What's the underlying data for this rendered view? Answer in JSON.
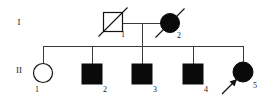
{
  "figure": {
    "type": "pedigree-chart",
    "width": 280,
    "height": 103,
    "background_color": "#ffffff",
    "line_color": "#3a3a3a",
    "symbol_color": "#0a0a0a"
  },
  "generations": [
    {
      "label": "I",
      "x": 19,
      "y": 25
    },
    {
      "label": "II",
      "x": 19,
      "y": 73
    }
  ],
  "individuals": [
    {
      "id": "I-1",
      "generation": "I",
      "number": "1",
      "sex": "male",
      "shape": "square",
      "affected": false,
      "fill": "open",
      "deceased": true,
      "proband": false,
      "cx": 113,
      "cy": 22,
      "size": 19,
      "label_x": 123,
      "label_y": 37
    },
    {
      "id": "I-2",
      "generation": "I",
      "number": "2",
      "sex": "female",
      "shape": "circle",
      "affected": true,
      "fill": "filled",
      "deceased": true,
      "proband": false,
      "cx": 170,
      "cy": 23,
      "size": 19,
      "label_x": 179,
      "label_y": 38
    },
    {
      "id": "II-1",
      "generation": "II",
      "number": "1",
      "sex": "female",
      "shape": "circle",
      "affected": false,
      "fill": "open",
      "deceased": false,
      "proband": false,
      "cx": 43,
      "cy": 73,
      "size": 19,
      "label_x": 37,
      "label_y": 92
    },
    {
      "id": "II-2",
      "generation": "II",
      "number": "2",
      "sex": "male",
      "shape": "square",
      "affected": true,
      "fill": "filled",
      "deceased": false,
      "proband": false,
      "cx": 92,
      "cy": 74,
      "size": 20,
      "label_x": 105,
      "label_y": 92
    },
    {
      "id": "II-3",
      "generation": "II",
      "number": "3",
      "sex": "male",
      "shape": "square",
      "affected": true,
      "fill": "filled",
      "deceased": false,
      "proband": false,
      "cx": 142,
      "cy": 74,
      "size": 20,
      "label_x": 155,
      "label_y": 92
    },
    {
      "id": "II-4",
      "generation": "II",
      "number": "4",
      "sex": "male",
      "shape": "square",
      "affected": true,
      "fill": "filled",
      "deceased": false,
      "proband": false,
      "cx": 193,
      "cy": 74,
      "size": 20,
      "label_x": 206,
      "label_y": 92
    },
    {
      "id": "II-5",
      "generation": "II",
      "number": "5",
      "sex": "female",
      "shape": "circle",
      "affected": true,
      "fill": "filled",
      "deceased": false,
      "proband": true,
      "cx": 243,
      "cy": 72,
      "size": 20,
      "label_x": 255,
      "label_y": 88
    }
  ],
  "connections": {
    "mating_line": {
      "x1": 122,
      "x2": 161,
      "y": 23
    },
    "descent_line": {
      "x": 142,
      "y1": 23,
      "y2": 46
    },
    "sibship_line": {
      "x1": 43,
      "x2": 243,
      "y": 46
    },
    "child_drops": [
      {
        "x": 43,
        "y1": 46,
        "y2": 64
      },
      {
        "x": 92,
        "y1": 46,
        "y2": 64
      },
      {
        "x": 142,
        "y1": 46,
        "y2": 64
      },
      {
        "x": 193,
        "y1": 46,
        "y2": 64
      },
      {
        "x": 243,
        "y1": 46,
        "y2": 62
      }
    ]
  },
  "legend_semantics": {
    "filled_symbol": "affected individual",
    "open_symbol": "unaffected individual",
    "square": "male",
    "circle": "female",
    "diagonal_slash": "deceased",
    "arrow": "proband"
  }
}
